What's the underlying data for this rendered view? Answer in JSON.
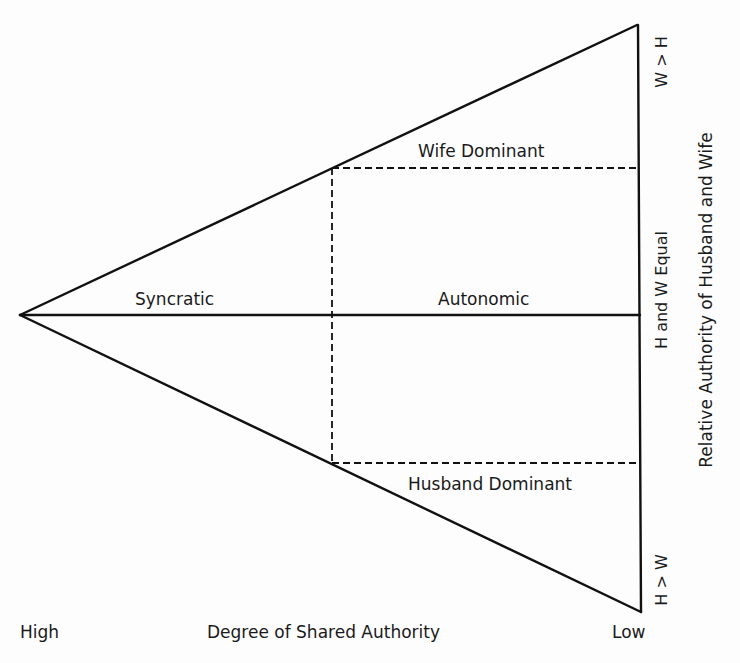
{
  "diagram": {
    "colors": {
      "line": "#111111",
      "background": "#fdfdfd",
      "text": "#1a1a1a"
    },
    "regions": {
      "syncratic": "Syncratic",
      "autonomic": "Autonomic",
      "wife_dominant": "Wife Dominant",
      "husband_dominant": "Husband Dominant"
    },
    "x_axis": {
      "label": "Degree of Shared Authority",
      "high": "High",
      "low": "Low"
    },
    "y_axis": {
      "label": "Relative Authority of Husband and Wife",
      "top": "W > H",
      "middle": "H and W Equal",
      "bottom": "H > W"
    }
  }
}
